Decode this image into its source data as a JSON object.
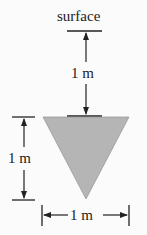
{
  "diagram": {
    "surface_label": "surface",
    "depth_label": "1 m",
    "height_label": "1 m",
    "width_label": "1 m",
    "shape": "inverted-triangle",
    "colors": {
      "fill": "#b5b5b5",
      "stroke": "#222222",
      "background": "#fbfbfb"
    }
  }
}
